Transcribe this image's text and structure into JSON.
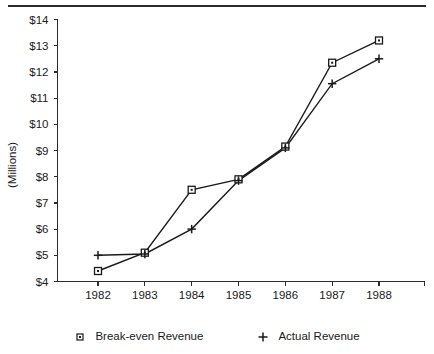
{
  "chart_data": {
    "type": "line",
    "title": "",
    "subtitle": "",
    "xlabel": "",
    "ylabel": "(Millions)",
    "categories": [
      "1982",
      "1983",
      "1984",
      "1985",
      "1986",
      "1987",
      "1988"
    ],
    "x": [
      1982,
      1983,
      1984,
      1985,
      1986,
      1987,
      1988
    ],
    "series": [
      {
        "name": "Break-even Revenue",
        "marker": "square",
        "values": [
          4.4,
          5.1,
          7.5,
          7.9,
          9.15,
          12.35,
          13.2
        ]
      },
      {
        "name": "Actual Revenue",
        "marker": "plus",
        "values": [
          5.0,
          5.05,
          6.0,
          7.85,
          9.1,
          11.55,
          12.5
        ]
      }
    ],
    "ylim": [
      4,
      14
    ],
    "ytick_values": [
      4,
      5,
      6,
      7,
      8,
      9,
      10,
      11,
      12,
      13,
      14
    ],
    "ytick_labels": [
      "$4",
      "$5",
      "$6",
      "$7",
      "$8",
      "$9",
      "$10",
      "$11",
      "$12",
      "$13",
      "$14"
    ],
    "xtick_labels": [
      "1982",
      "1983",
      "1984",
      "1985",
      "1986",
      "1987",
      "1988"
    ],
    "grid": false,
    "legend_position": "bottom",
    "line_color": "#1a1a1a",
    "axis_color": "#2b2b2b",
    "background_color": "#ffffff"
  },
  "legend": {
    "items": [
      {
        "label": "Break-even Revenue",
        "marker": "square-marker"
      },
      {
        "label": "Actual Revenue",
        "marker": "plus-marker"
      }
    ]
  },
  "axis_titles": {
    "y": "(Millions)"
  }
}
